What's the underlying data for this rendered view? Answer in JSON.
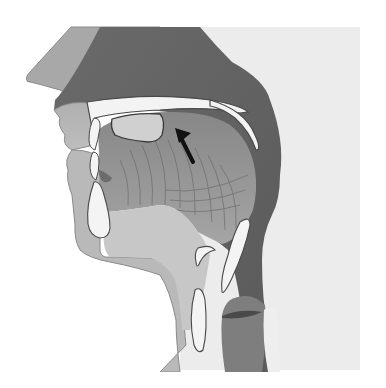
{
  "diagram": {
    "kind": "sagittal section of the human head and neck (vocal tract)",
    "labels": [],
    "annotations": [
      {
        "type": "arrow",
        "direction": "up-left",
        "points_to": "hard palate / upper tongue region behind the palate",
        "color": "#111111"
      }
    ],
    "structures": [
      {
        "name": "nose",
        "color": "#a9a9a9"
      },
      {
        "name": "nasal-cavity",
        "color": "#6e6e6e"
      },
      {
        "name": "hard-palate",
        "color": "#f2f2f2"
      },
      {
        "name": "soft-palate-velum",
        "color": "#f2f2f2"
      },
      {
        "name": "upper-lip",
        "color": "#b5b5b5"
      },
      {
        "name": "lower-lip",
        "color": "#b5b5b5"
      },
      {
        "name": "teeth",
        "color": "#f4f4f4"
      },
      {
        "name": "mandible",
        "color": "#f4f4f4"
      },
      {
        "name": "tongue",
        "color": "#8d8d8d"
      },
      {
        "name": "pharynx",
        "color": "#5d5d5d"
      },
      {
        "name": "epiglottis",
        "color": "#f4f4f4"
      },
      {
        "name": "hyoid-bone",
        "color": "#f4f4f4"
      },
      {
        "name": "larynx",
        "color": "#7b7b7b"
      },
      {
        "name": "vocal-folds",
        "color": "#4a4a4a"
      },
      {
        "name": "esophagus",
        "color": "#f0f0f0"
      },
      {
        "name": "neck-background",
        "color": "#ececec"
      }
    ]
  },
  "colors": {
    "background": "#ffffff",
    "skin_light": "#b8b8b8",
    "dark_cavity": "#666666",
    "mid_tissue": "#909090",
    "bone": "#f3f3f3",
    "outline": "#3a3a3a"
  }
}
